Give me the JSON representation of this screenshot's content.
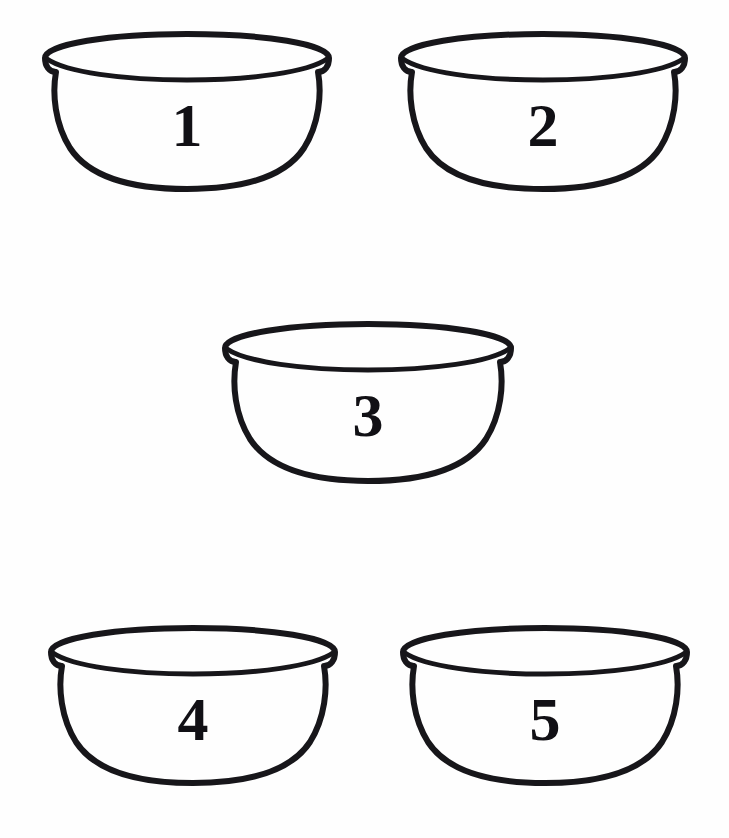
{
  "figure": {
    "background_color": "#fefefe",
    "ink_color": "#17161a",
    "medium": "line drawing",
    "layout": "two bowls top row, one bowl middle row, two bowls bottom row"
  },
  "bowls": [
    {
      "id": "bowl-1",
      "label": "1",
      "row": "top",
      "position": "left",
      "left": 36,
      "top": 28,
      "width": 302,
      "height": 164
    },
    {
      "id": "bowl-2",
      "label": "2",
      "row": "top",
      "position": "right",
      "left": 392,
      "top": 28,
      "width": 302,
      "height": 164
    },
    {
      "id": "bowl-3",
      "label": "3",
      "row": "middle",
      "position": "center",
      "left": 216,
      "top": 318,
      "width": 304,
      "height": 166
    },
    {
      "id": "bowl-4",
      "label": "4",
      "row": "bottom",
      "position": "left",
      "left": 42,
      "top": 622,
      "width": 302,
      "height": 164
    },
    {
      "id": "bowl-5",
      "label": "5",
      "row": "bottom",
      "position": "right",
      "left": 394,
      "top": 622,
      "width": 302,
      "height": 164
    }
  ]
}
